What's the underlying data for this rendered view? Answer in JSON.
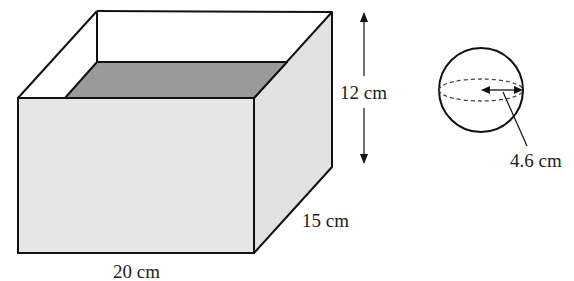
{
  "diagram": {
    "type": "geometry-figure",
    "box": {
      "shape": "open-top cuboid partially filled with water",
      "labels": {
        "length": "20 cm",
        "width": "15 cm",
        "height": "12 cm"
      }
    },
    "sphere": {
      "shape": "sphere",
      "labels": {
        "radius": "4.6 cm"
      }
    },
    "colors": {
      "outline": "#111111",
      "front_face": "#e6e6e6",
      "side_face": "#e2e2e2",
      "water_surface": "#9a9a9a",
      "background": "#ffffff"
    }
  }
}
